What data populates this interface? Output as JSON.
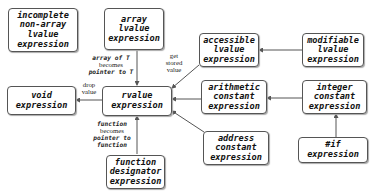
{
  "nodes": {
    "incomplete": [
      "incomplete",
      "non-array",
      "lvalue",
      "expression"
    ],
    "array": [
      "array",
      "lvalue",
      "expression"
    ],
    "accessible": [
      "accessible",
      "lvalue",
      "expression"
    ],
    "modifiable": [
      "modifiable",
      "lvalue",
      "expression"
    ],
    "void": [
      "void",
      "expression"
    ],
    "rvalue": [
      "rvalue",
      "expression"
    ],
    "arithmetic": [
      "arithmetic",
      "constant",
      "expression"
    ],
    "integer": [
      "integer",
      "constant",
      "expression"
    ],
    "address": [
      "address",
      "constant",
      "expression"
    ],
    "if": [
      "#if",
      "expression"
    ],
    "function": [
      "function",
      "designator",
      "expression"
    ]
  },
  "edges": {
    "array_to_rvalue": [
      "array of T",
      "becomes",
      "pointer to T"
    ],
    "accessible_to_rvalue": [
      "get",
      "stored",
      "value"
    ],
    "rvalue_to_void": [
      "drop",
      "value"
    ],
    "function_to_rvalue": [
      "function",
      "becomes",
      "pointer to",
      "function"
    ]
  },
  "colors": {
    "line": "#555555",
    "text": "#111111"
  }
}
